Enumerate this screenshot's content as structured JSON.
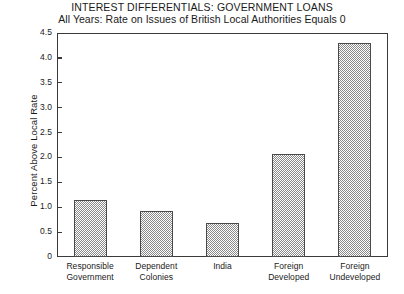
{
  "chart_data": {
    "type": "bar",
    "title": "INTEREST DIFFERENTIALS: GOVERNMENT LOANS",
    "subtitle": "All Years: Rate on Issues of British Local Authorities Equals 0",
    "xlabel": "",
    "ylabel": "Percent Above Local Rate",
    "categories": [
      "Responsible Government",
      "Dependent Colonies",
      "India",
      "Foreign Developed",
      "Foreign Undeveloped"
    ],
    "category_lines": [
      [
        "Responsible",
        "Government"
      ],
      [
        "Dependent",
        "Colonies"
      ],
      [
        "India",
        ""
      ],
      [
        "Foreign",
        "Developed"
      ],
      [
        "Foreign",
        "Undeveloped"
      ]
    ],
    "values": [
      1.14,
      0.92,
      0.68,
      2.06,
      4.3
    ],
    "ylim": [
      0,
      4.5
    ],
    "yticks": [
      "0",
      "0.5",
      "1.0",
      "1.5",
      "2.0",
      "2.5",
      "3.0",
      "3.5",
      "4.0",
      "4.5"
    ],
    "ytick_values": [
      0,
      0.5,
      1.0,
      1.5,
      2.0,
      2.5,
      3.0,
      3.5,
      4.0,
      4.5
    ],
    "grid": false,
    "legend": false,
    "bar_fill_color": "#8a8a8a",
    "bar_edge_color": "#4a4a4a",
    "axis_color": "#3a3a3a",
    "background_color": "#ffffff"
  }
}
